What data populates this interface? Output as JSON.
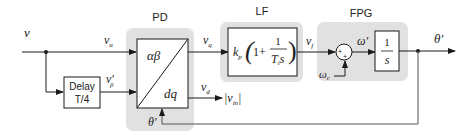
{
  "diagram": {
    "type": "block-diagram",
    "blocks": {
      "pd": {
        "title": "PD",
        "in_label": "αβ",
        "out_label": "dq",
        "feedback_label": "θ′"
      },
      "lf": {
        "title": "LF",
        "kp": "k",
        "kp_sub": "p",
        "one_plus": "1+",
        "num": "1",
        "den": "T",
        "den_sub": "i",
        "den_s": "s"
      },
      "fpg": {
        "title": "FPG",
        "sum_plus_top": "+",
        "sum_plus_bottom": "+",
        "omega_prime": "ω′",
        "omega_c": "ω",
        "omega_c_sub": "c",
        "int_num": "1",
        "int_den": "s"
      },
      "delay": {
        "line1": "Delay",
        "line2": "T/4"
      }
    },
    "signals": {
      "v": "v",
      "v_alpha": "v",
      "v_alpha_sub": "α",
      "v_beta": "v′",
      "v_beta_sub": "β",
      "v_q": "v",
      "v_q_sub": "q",
      "v_d": "v",
      "v_d_sub": "d",
      "v_in": "|v",
      "v_in_sub": "in",
      "v_in_close": "|",
      "v_f": "v",
      "v_f_sub": "f",
      "theta_out": "θ′"
    },
    "colors": {
      "group_fill": "#e1e1e1",
      "line": "#1a1a1a",
      "feedback_line": "#555555"
    }
  }
}
